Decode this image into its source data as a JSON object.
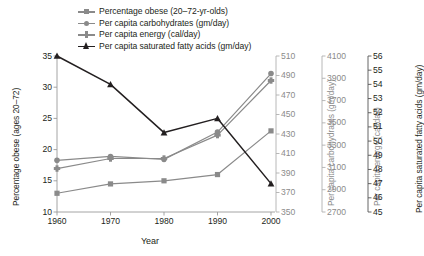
{
  "chart_data": {
    "type": "line",
    "title": "",
    "xlabel": "Year",
    "x": [
      1960,
      1970,
      1980,
      1990,
      2000
    ],
    "xtick_labels": [
      "1960",
      "1970",
      "1980",
      "1990",
      "2000"
    ],
    "xlim": [
      1960,
      2000
    ],
    "grid": false,
    "legend_position": "top-left",
    "axes": [
      {
        "id": "obese",
        "side": "left",
        "label": "Percentage obese (ages 20–72)",
        "lim": [
          10,
          35
        ],
        "ticks": [
          10,
          15,
          20,
          25,
          30,
          35
        ],
        "tick_labels": [
          "10",
          "15",
          "20",
          "25",
          "30",
          "35"
        ],
        "color": "#231f20"
      },
      {
        "id": "carbohydrates",
        "side": "right",
        "label": "Per capita carbohydrates (gm/day)",
        "lim": [
          350,
          510
        ],
        "ticks": [
          350,
          370,
          390,
          410,
          430,
          450,
          470,
          490,
          510
        ],
        "tick_labels": [
          "350",
          "370",
          "390",
          "410",
          "430",
          "450",
          "470",
          "490",
          "510"
        ],
        "color": "#8b8b8b"
      },
      {
        "id": "energy",
        "side": "right",
        "label": "Per capita energy (cal/day)",
        "lim": [
          2700,
          4100
        ],
        "ticks": [
          2700,
          2900,
          3100,
          3300,
          3500,
          3700,
          3900,
          4100
        ],
        "tick_labels": [
          "2700",
          "2900",
          "3100",
          "3300",
          "3500",
          "3700",
          "3900",
          "4100"
        ],
        "color": "#8b8b8b"
      },
      {
        "id": "sfa",
        "side": "right",
        "label": "Per capita saturated fatty acids (gm/day)",
        "lim": [
          45,
          56
        ],
        "ticks": [
          45,
          46,
          47,
          48,
          49,
          50,
          51,
          52,
          53,
          54,
          55,
          56
        ],
        "tick_labels": [
          "45",
          "46",
          "47",
          "48",
          "49",
          "50",
          "51",
          "52",
          "53",
          "54",
          "55",
          "56"
        ],
        "color": "#231f20"
      }
    ],
    "series": [
      {
        "name": "Percentage obese (20–72-yr-olds)",
        "axis": "obese",
        "values": [
          13.0,
          14.5,
          15.0,
          16.0,
          23.0
        ],
        "color": "#8a8a8a",
        "marker": "square"
      },
      {
        "name": "Per capita carbohydrates (gm/day)",
        "axis": "carbohydrates",
        "values": [
          403,
          407,
          404,
          432,
          492
        ],
        "color": "#8a8a8a",
        "marker": "circle"
      },
      {
        "name": "Per capita energy (cal/day)",
        "axis": "energy",
        "values": [
          3090,
          3180,
          3180,
          3390,
          3880
        ],
        "color": "#8a8a8a",
        "marker": "cross"
      },
      {
        "name": "Per capita saturated fatty acids (gm/day)",
        "axis": "sfa",
        "values": [
          56.0,
          54.0,
          50.6,
          51.6,
          47.0
        ],
        "color": "#231f20",
        "marker": "triangle"
      }
    ]
  },
  "legend": {
    "items": [
      {
        "label": "Percentage obese (20–72-yr-olds)",
        "color": "#8a8a8a",
        "marker": "square"
      },
      {
        "label": "Per capita carbohydrates (gm/day)",
        "color": "#8a8a8a",
        "marker": "circle"
      },
      {
        "label": "Per capita energy (cal/day)",
        "color": "#8a8a8a",
        "marker": "cross"
      },
      {
        "label": "Per capita saturated fatty acids (gm/day)",
        "color": "#231f20",
        "marker": "triangle"
      }
    ]
  }
}
